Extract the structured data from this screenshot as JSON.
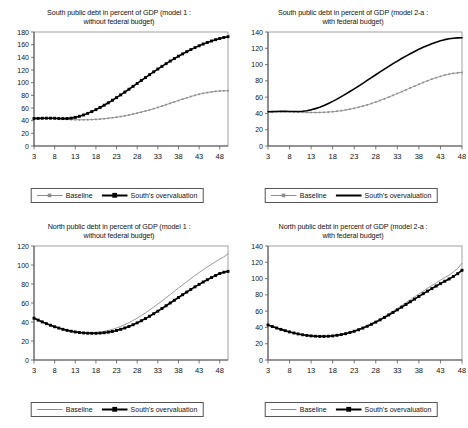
{
  "figure": {
    "width": 468,
    "height": 428,
    "background": "#ffffff"
  },
  "legend": {
    "baseline_label": "Baseline",
    "overvaluation_label": "South's overvaluation"
  },
  "colors": {
    "baseline": "#8c8c8c",
    "overvaluation": "#000000",
    "axis": "#595959",
    "frame": "#7a7a7a",
    "text": "#111111"
  },
  "chart_data": [
    {
      "id": "south-model-1",
      "type": "line",
      "title": "South public debt in percent of GDP (model 1 : without federal budget)",
      "title_line1": "South public debt in percent of GDP (model 1 :",
      "title_line2": "without federal budget)",
      "xlabel": "",
      "ylabel": "",
      "xlim": [
        3,
        50
      ],
      "ylim": [
        0,
        180
      ],
      "ytick_step": 20,
      "yticks": [
        0,
        20,
        40,
        60,
        80,
        100,
        120,
        140,
        160,
        180
      ],
      "xticks": [
        3,
        8,
        13,
        18,
        23,
        28,
        33,
        38,
        43,
        48
      ],
      "grid": false,
      "legend_position": "below-axis",
      "x": [
        3,
        4,
        5,
        6,
        7,
        8,
        9,
        10,
        11,
        12,
        13,
        14,
        15,
        16,
        17,
        18,
        19,
        20,
        21,
        22,
        23,
        24,
        25,
        26,
        27,
        28,
        29,
        30,
        31,
        32,
        33,
        34,
        35,
        36,
        37,
        38,
        39,
        40,
        41,
        42,
        43,
        44,
        45,
        46,
        47,
        48,
        49,
        50
      ],
      "series": [
        {
          "name": "Baseline",
          "style": "thin-gray-with-markers",
          "values": [
            43.5,
            43.5,
            43.6,
            43.6,
            43.5,
            43.3,
            42.9,
            42.4,
            42.0,
            41.7,
            41.5,
            41.4,
            41.4,
            41.5,
            41.7,
            42.0,
            42.5,
            43.1,
            43.8,
            44.6,
            45.5,
            46.5,
            47.7,
            49.0,
            50.4,
            51.9,
            53.5,
            55.2,
            57.0,
            58.9,
            60.9,
            63.0,
            65.2,
            67.4,
            69.6,
            71.8,
            74.0,
            76.1,
            78.1,
            80.0,
            81.7,
            83.2,
            84.4,
            85.4,
            86.2,
            86.8,
            87.2,
            87.4
          ]
        },
        {
          "name": "South's overvaluation",
          "style": "thick-black-with-markers",
          "values": [
            43.5,
            43.6,
            43.8,
            43.9,
            43.9,
            43.8,
            43.5,
            43.3,
            43.4,
            44.0,
            45.2,
            46.9,
            49.0,
            51.5,
            54.3,
            57.4,
            60.8,
            64.4,
            68.2,
            72.2,
            76.4,
            80.7,
            85.1,
            89.6,
            94.2,
            98.8,
            103.4,
            108.0,
            112.6,
            117.1,
            121.5,
            125.8,
            130.0,
            134.1,
            138.0,
            141.8,
            145.4,
            148.9,
            152.2,
            155.3,
            158.2,
            161.0,
            163.5,
            165.8,
            167.9,
            169.8,
            171.4,
            172.6
          ]
        }
      ]
    },
    {
      "id": "south-model-2a",
      "type": "line",
      "title": "South public debt in percent of GDP (model 2-a : with federal budget)",
      "title_line1": "South public debt in percent of GDP (model 2-a :",
      "title_line2": "with federal budget)",
      "xlabel": "",
      "ylabel": "",
      "xlim": [
        3,
        48
      ],
      "ylim": [
        0,
        140
      ],
      "ytick_step": 20,
      "yticks": [
        0,
        20,
        40,
        60,
        80,
        100,
        120,
        140
      ],
      "xticks": [
        3,
        8,
        13,
        18,
        23,
        28,
        33,
        38,
        43,
        48
      ],
      "grid": false,
      "legend_position": "below-axis",
      "x": [
        3,
        4,
        5,
        6,
        7,
        8,
        9,
        10,
        11,
        12,
        13,
        14,
        15,
        16,
        17,
        18,
        19,
        20,
        21,
        22,
        23,
        24,
        25,
        26,
        27,
        28,
        29,
        30,
        31,
        32,
        33,
        34,
        35,
        36,
        37,
        38,
        39,
        40,
        41,
        42,
        43,
        44,
        45,
        46,
        47,
        48
      ],
      "series": [
        {
          "name": "Baseline",
          "style": "thin-gray-with-markers",
          "values": [
            42.0,
            42.1,
            42.2,
            42.3,
            42.3,
            42.2,
            42.0,
            41.7,
            41.4,
            41.2,
            41.1,
            41.1,
            41.2,
            41.4,
            41.7,
            42.1,
            42.7,
            43.4,
            44.2,
            45.2,
            46.3,
            47.6,
            49.0,
            50.5,
            52.2,
            54.0,
            55.9,
            57.9,
            60.0,
            62.2,
            64.4,
            66.7,
            69.0,
            71.3,
            73.6,
            75.8,
            78.0,
            80.1,
            82.1,
            83.9,
            85.5,
            87.0,
            88.2,
            89.2,
            89.9,
            90.3
          ]
        },
        {
          "name": "South's overvaluation",
          "style": "thick-black-plain",
          "values": [
            42.0,
            42.2,
            42.4,
            42.5,
            42.5,
            42.4,
            42.3,
            42.3,
            42.6,
            43.3,
            44.4,
            45.9,
            47.7,
            49.8,
            52.2,
            54.8,
            57.6,
            60.6,
            63.7,
            66.9,
            70.2,
            73.6,
            77.0,
            80.5,
            84.0,
            87.5,
            91.0,
            94.4,
            97.8,
            101.1,
            104.3,
            107.4,
            110.4,
            113.3,
            116.1,
            118.7,
            121.2,
            123.5,
            125.6,
            127.5,
            129.2,
            130.6,
            131.7,
            132.4,
            132.8,
            132.9
          ]
        }
      ]
    },
    {
      "id": "north-model-1",
      "type": "line",
      "title": "North public debt in percent of GDP (model 1 : without federal budget)",
      "title_line1": "North public debt in percent of GDP (model 1 :",
      "title_line2": "without federal budget)",
      "xlabel": "",
      "ylabel": "",
      "xlim": [
        3,
        50
      ],
      "ylim": [
        0,
        120
      ],
      "ytick_step": 20,
      "yticks": [
        0,
        20,
        40,
        60,
        80,
        100,
        120
      ],
      "xticks": [
        3,
        8,
        13,
        18,
        23,
        28,
        33,
        38,
        43,
        48
      ],
      "grid": false,
      "legend_position": "below-axis",
      "x": [
        3,
        4,
        5,
        6,
        7,
        8,
        9,
        10,
        11,
        12,
        13,
        14,
        15,
        16,
        17,
        18,
        19,
        20,
        21,
        22,
        23,
        24,
        25,
        26,
        27,
        28,
        29,
        30,
        31,
        32,
        33,
        34,
        35,
        36,
        37,
        38,
        39,
        40,
        41,
        42,
        43,
        44,
        45,
        46,
        47,
        48,
        49,
        50
      ],
      "series": [
        {
          "name": "Baseline",
          "style": "thin-gray-plain",
          "values": [
            44.2,
            42.2,
            40.3,
            38.5,
            36.8,
            35.3,
            33.9,
            32.7,
            31.6,
            30.7,
            30.0,
            29.4,
            29.0,
            28.8,
            28.8,
            29.0,
            29.5,
            30.2,
            31.1,
            32.3,
            33.7,
            35.3,
            37.2,
            39.3,
            41.6,
            44.1,
            46.8,
            49.6,
            52.6,
            55.7,
            58.9,
            62.2,
            65.5,
            68.9,
            72.3,
            75.7,
            79.1,
            82.4,
            85.7,
            88.9,
            92.0,
            95.0,
            98.0,
            100.8,
            103.5,
            106.1,
            108.6,
            111.8
          ]
        },
        {
          "name": "South's overvaluation",
          "style": "thick-black-with-markers",
          "values": [
            44.0,
            42.0,
            40.1,
            38.3,
            36.6,
            35.0,
            33.6,
            32.3,
            31.2,
            30.3,
            29.5,
            28.9,
            28.5,
            28.2,
            28.1,
            28.1,
            28.3,
            28.7,
            29.3,
            30.1,
            31.1,
            32.3,
            33.7,
            35.3,
            37.1,
            39.1,
            41.3,
            43.6,
            46.1,
            48.7,
            51.4,
            54.2,
            57.1,
            60.0,
            62.9,
            65.8,
            68.7,
            71.5,
            74.3,
            77.0,
            79.6,
            82.1,
            84.5,
            86.8,
            89.0,
            91.0,
            92.4,
            93.3
          ]
        }
      ]
    },
    {
      "id": "north-model-2a",
      "type": "line",
      "title": "North public debt in percent of GDP (model 2-a : with federal budget)",
      "title_line1": "North public debt in percent of GDP (model 2-a :",
      "title_line2": "with federal budget)",
      "xlabel": "",
      "ylabel": "",
      "xlim": [
        3,
        48
      ],
      "ylim": [
        0,
        140
      ],
      "ytick_step": 20,
      "yticks": [
        0,
        20,
        40,
        60,
        80,
        100,
        120,
        140
      ],
      "xticks": [
        3,
        8,
        13,
        18,
        23,
        28,
        33,
        38,
        43,
        48
      ],
      "grid": false,
      "legend_position": "below-axis",
      "x": [
        3,
        4,
        5,
        6,
        7,
        8,
        9,
        10,
        11,
        12,
        13,
        14,
        15,
        16,
        17,
        18,
        19,
        20,
        21,
        22,
        23,
        24,
        25,
        26,
        27,
        28,
        29,
        30,
        31,
        32,
        33,
        34,
        35,
        36,
        37,
        38,
        39,
        40,
        41,
        42,
        43,
        44,
        45,
        46,
        47,
        48
      ],
      "series": [
        {
          "name": "Baseline",
          "style": "thin-gray-plain",
          "values": [
            43.2,
            41.3,
            39.5,
            37.8,
            36.2,
            34.7,
            33.4,
            32.2,
            31.2,
            30.4,
            29.8,
            29.4,
            29.2,
            29.2,
            29.4,
            29.9,
            30.6,
            31.5,
            32.7,
            34.1,
            35.8,
            37.7,
            39.8,
            42.2,
            44.7,
            47.5,
            50.4,
            53.5,
            56.7,
            60.0,
            63.4,
            66.9,
            70.4,
            74.0,
            77.5,
            81.0,
            84.5,
            88.0,
            91.4,
            94.7,
            98.0,
            101.2,
            104.3,
            108.0,
            112.5,
            118.8
          ]
        },
        {
          "name": "South's overvaluation",
          "style": "thick-black-with-markers",
          "values": [
            43.0,
            41.1,
            39.3,
            37.6,
            36.0,
            34.5,
            33.2,
            32.0,
            31.0,
            30.2,
            29.6,
            29.2,
            29.0,
            29.0,
            29.2,
            29.6,
            30.3,
            31.2,
            32.3,
            33.7,
            35.3,
            37.1,
            39.2,
            41.4,
            43.9,
            46.5,
            49.3,
            52.2,
            55.3,
            58.4,
            61.6,
            64.9,
            68.2,
            71.5,
            74.8,
            78.1,
            81.4,
            84.6,
            87.7,
            90.8,
            93.8,
            96.7,
            99.5,
            102.6,
            106.0,
            110.2
          ]
        }
      ]
    }
  ]
}
